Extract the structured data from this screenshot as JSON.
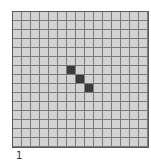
{
  "figure": {
    "label": "1",
    "grid": {
      "rows": 15,
      "cols": 15,
      "cell_color": "#d3d3d3",
      "filled_color": "#3b3b3b",
      "line_color": "#7a7a7a",
      "filled_cells": [
        {
          "row": 6,
          "col": 6
        },
        {
          "row": 7,
          "col": 7
        },
        {
          "row": 8,
          "col": 8
        }
      ]
    }
  }
}
